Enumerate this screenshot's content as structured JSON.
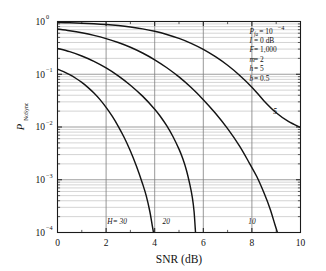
{
  "chart_data": {
    "type": "line",
    "title": "",
    "xlabel": "SNR (dB)",
    "ylabel": "P_NoSync",
    "ylabel_base": "P",
    "ylabel_sub": "NoSync",
    "xlim": [
      0,
      10
    ],
    "ylim": [
      0.0001,
      1
    ],
    "yscale": "log",
    "xscale": "linear",
    "grid": true,
    "grid_style": "log-minor-horizontal-and-major-vertical",
    "legend": "inline-curve-labels",
    "xticks": [
      "0",
      "2",
      "4",
      "6",
      "8",
      "10"
    ],
    "xtick_values": [
      0,
      2,
      4,
      6,
      8,
      10
    ],
    "yticks": [
      "10^0",
      "10^-1",
      "10^-2",
      "10^-3",
      "10^-4"
    ],
    "ytick_mantissa": "10",
    "ytick_exponents": [
      "0",
      "-1",
      "-2",
      "-3",
      "-4"
    ],
    "ytick_values": [
      1,
      0.1,
      0.01,
      0.001,
      0.0001
    ],
    "series": [
      {
        "name": "H = 30",
        "label": "H = 30",
        "label_italic_part": "H",
        "label_rest": " = 30",
        "label_x": 2.05,
        "label_y": 0.000145,
        "points": [
          [
            0.0,
            0.125
          ],
          [
            0.25,
            0.112
          ],
          [
            0.5,
            0.098
          ],
          [
            0.75,
            0.084
          ],
          [
            1.0,
            0.07
          ],
          [
            1.25,
            0.0565
          ],
          [
            1.5,
            0.044
          ],
          [
            1.75,
            0.033
          ],
          [
            2.0,
            0.0235
          ],
          [
            2.25,
            0.016
          ],
          [
            2.5,
            0.0103
          ],
          [
            2.75,
            0.00625
          ],
          [
            3.0,
            0.0035
          ],
          [
            3.25,
            0.0018
          ],
          [
            3.5,
            0.00084
          ],
          [
            3.65,
            0.0005
          ],
          [
            3.8,
            0.00025
          ],
          [
            3.9,
            0.000135
          ],
          [
            3.95,
            0.0001
          ]
        ]
      },
      {
        "name": "20",
        "label": "20",
        "label_x": 4.32,
        "label_y": 0.000145,
        "points": [
          [
            0.0,
            0.31
          ],
          [
            0.5,
            0.268
          ],
          [
            1.0,
            0.222
          ],
          [
            1.5,
            0.176
          ],
          [
            2.0,
            0.132
          ],
          [
            2.5,
            0.0935
          ],
          [
            3.0,
            0.062
          ],
          [
            3.5,
            0.0385
          ],
          [
            4.0,
            0.0218
          ],
          [
            4.25,
            0.0155
          ],
          [
            4.5,
            0.0105
          ],
          [
            4.75,
            0.0066
          ],
          [
            5.0,
            0.0038
          ],
          [
            5.15,
            0.00255
          ],
          [
            5.3,
            0.00155
          ],
          [
            5.45,
            0.0008
          ],
          [
            5.55,
            0.00046
          ],
          [
            5.62,
            0.00025
          ],
          [
            5.68,
            0.0001
          ]
        ]
      },
      {
        "name": "10",
        "label": "10",
        "label_x": 7.85,
        "label_y": 0.000145,
        "points": [
          [
            0.0,
            0.72
          ],
          [
            0.5,
            0.668
          ],
          [
            1.0,
            0.61
          ],
          [
            1.5,
            0.545
          ],
          [
            2.0,
            0.474
          ],
          [
            2.5,
            0.4
          ],
          [
            3.0,
            0.325
          ],
          [
            3.5,
            0.253
          ],
          [
            4.0,
            0.188
          ],
          [
            4.5,
            0.133
          ],
          [
            5.0,
            0.089
          ],
          [
            5.5,
            0.056
          ],
          [
            6.0,
            0.033
          ],
          [
            6.5,
            0.0182
          ],
          [
            7.0,
            0.0093
          ],
          [
            7.5,
            0.0043
          ],
          [
            7.9,
            0.00205
          ],
          [
            8.2,
            0.00115
          ],
          [
            8.5,
            0.00056
          ],
          [
            8.75,
            0.00028
          ],
          [
            8.95,
            0.00014
          ],
          [
            9.05,
            0.0001
          ]
        ]
      },
      {
        "name": "5",
        "label": "5",
        "label_x": 8.88,
        "label_y": 0.0175,
        "points": [
          [
            0.0,
            0.955
          ],
          [
            0.5,
            0.945
          ],
          [
            1.0,
            0.93
          ],
          [
            1.5,
            0.908
          ],
          [
            2.0,
            0.878
          ],
          [
            2.5,
            0.838
          ],
          [
            3.0,
            0.788
          ],
          [
            3.5,
            0.726
          ],
          [
            4.0,
            0.652
          ],
          [
            4.5,
            0.568
          ],
          [
            5.0,
            0.478
          ],
          [
            5.5,
            0.386
          ],
          [
            6.0,
            0.296
          ],
          [
            6.5,
            0.215
          ],
          [
            7.0,
            0.148
          ],
          [
            7.5,
            0.095
          ],
          [
            8.0,
            0.057
          ],
          [
            8.5,
            0.0312
          ],
          [
            9.0,
            0.0186
          ],
          [
            9.5,
            0.01275
          ],
          [
            10.0,
            0.0098
          ]
        ]
      }
    ],
    "annotations": [
      {
        "symbol": "P",
        "sub": "fa",
        "text": " = 10",
        "sup": "−4"
      },
      {
        "symbol": "I",
        "sub": "",
        "text": " = 0 dB",
        "sup": ""
      },
      {
        "symbol": "F",
        "sub": "",
        "text": " = 1,000",
        "sup": ""
      },
      {
        "symbol": "m",
        "sub": "",
        "text": " = 2",
        "sup": ""
      },
      {
        "symbol": "h",
        "sub": "",
        "text": " = 5",
        "sup": ""
      },
      {
        "symbol": "b",
        "sub": "",
        "text": " = 0.5",
        "sup": ""
      }
    ]
  },
  "colors": {
    "background": "#ffffff",
    "axis": "#1a1a1a",
    "curve": "#141414",
    "grid_major": "#8c8c8c",
    "grid_minor": "#b0b0b0",
    "text": "#111111"
  }
}
